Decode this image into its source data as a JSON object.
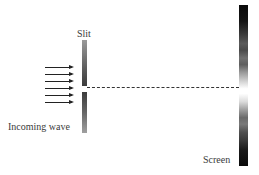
{
  "diagram": {
    "labels": {
      "slit": "Slit",
      "incoming_wave": "Incoming wave",
      "screen": "Screen"
    },
    "incoming_arrows": {
      "count": 6,
      "direction": "right"
    },
    "elements": [
      {
        "name": "incoming-wave-arrows",
        "type": "arrows",
        "count": 6
      },
      {
        "name": "slit-barrier",
        "type": "barrier-with-gap",
        "label": "Slit"
      },
      {
        "name": "center-axis",
        "type": "dashed-line"
      },
      {
        "name": "detection-screen",
        "type": "intensity-gradient",
        "label": "Screen",
        "pattern": "dark-edges-bright-center-with-fringes"
      }
    ],
    "colors": {
      "arrow": "#222222",
      "barrier": "#555555",
      "screen_dark": "#0a0a0a",
      "screen_bright": "#ffffff",
      "text": "#3a3a3a"
    }
  }
}
